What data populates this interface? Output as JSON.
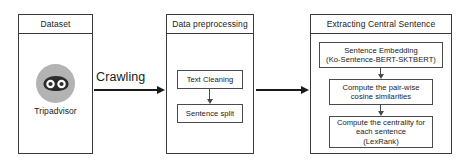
{
  "figure": {
    "type": "flow-diagram",
    "panels": [
      {
        "id": "dataset",
        "title": "Dataset",
        "logo": {
          "icon_name": "tripadvisor-owl-icon",
          "label": "Tripadvisor",
          "circle_color": "#b3b3b3",
          "owl_color": "#2b2b2b"
        }
      },
      {
        "id": "preprocessing",
        "title": "Data preprocessing",
        "steps": [
          {
            "id": "text-cleaning",
            "lines": [
              "Text Cleaning"
            ]
          },
          {
            "id": "sentence-split",
            "lines": [
              "Sentence split"
            ]
          }
        ]
      },
      {
        "id": "central-sentence",
        "title": "Extracting Central Sentence",
        "steps": [
          {
            "id": "sentence-embedding",
            "lines": [
              "Sentence Embedding",
              "(Ko-Sentence-BERT-SKTBERT)"
            ]
          },
          {
            "id": "cosine-similarity",
            "lines": [
              "Compute the pair-wise",
              "cosine similarities"
            ]
          },
          {
            "id": "centrality",
            "lines": [
              "Compute the centrality for",
              "each sentence",
              "(LexRank)"
            ]
          }
        ]
      }
    ],
    "arrows": [
      {
        "id": "crawling",
        "label": "Crawling",
        "from": "dataset",
        "to": "preprocessing"
      },
      {
        "id": "feed",
        "label": "",
        "from": "preprocessing",
        "to": "central-sentence"
      }
    ],
    "colors": {
      "border": "#3a3a3a",
      "inner_border": "#4a4a4a",
      "arrow": "#1a1a1a",
      "text": "#1a1a1a",
      "background": "#ffffff"
    }
  }
}
